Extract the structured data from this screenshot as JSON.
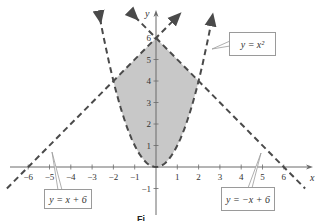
{
  "chart_data": {
    "type": "line",
    "title": "",
    "xlabel": "x",
    "ylabel": "y",
    "xlim": [
      -7,
      7.3
    ],
    "ylim": [
      -1.5,
      7.2
    ],
    "grid": false,
    "x_ticks": [
      -6,
      -5,
      -4,
      -3,
      -2,
      -1,
      1,
      2,
      3,
      4,
      5,
      6
    ],
    "y_ticks": [
      -1,
      1,
      2,
      3,
      4,
      5,
      6
    ],
    "series": [
      {
        "name": "y = x^2",
        "style": "dashed",
        "expr": "x^2",
        "x_range": [
          -2.63,
          2.63
        ]
      },
      {
        "name": "y = x + 6",
        "style": "dashed",
        "expr": "x+6",
        "x_range": [
          -7,
          1
        ]
      },
      {
        "name": "y = -x + 6",
        "style": "dashed",
        "expr": "-x+6",
        "x_range": [
          -1,
          7
        ]
      }
    ],
    "shaded_region": {
      "description": "Region where x^2 < y < -|x| + 6",
      "vertices_of_boundary": [
        [
          -2,
          4
        ],
        [
          0,
          6
        ],
        [
          2,
          4
        ]
      ],
      "lower_boundary": "y = x^2",
      "color": "#c8c8c8"
    },
    "intersections": [
      [
        -2,
        4
      ],
      [
        2,
        4
      ],
      [
        0,
        6
      ]
    ],
    "annotations": [
      {
        "text": "y = x²",
        "points_to": "y = x^2"
      },
      {
        "text": "y = x + 6",
        "points_to": "y = x + 6"
      },
      {
        "text": "y = −x + 6",
        "points_to": "y = -x + 6"
      }
    ]
  },
  "labels": {
    "x_axis": "x",
    "y_axis": "y",
    "parabola_callout": "y = x²",
    "left_line_callout": "y = x + 6",
    "right_line_callout": "y = −x + 6",
    "caption_fragment": "Fi"
  },
  "ticks": {
    "x": [
      "−6",
      "−5",
      "−4",
      "−3",
      "−2",
      "−1",
      "1",
      "2",
      "3",
      "4",
      "5",
      "6"
    ],
    "y": [
      "−1",
      "1",
      "2",
      "3",
      "4",
      "5",
      "6"
    ]
  },
  "colors": {
    "curve": "#4a4a4a",
    "axis": "#6a6a6a",
    "shade": "#c8c8c8",
    "callout_border": "#9a9a9a"
  }
}
